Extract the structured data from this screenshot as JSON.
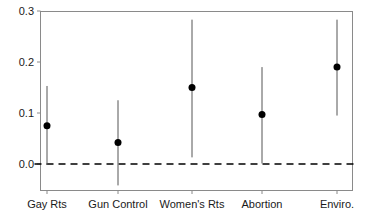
{
  "chart_data": {
    "type": "scatter",
    "title": "",
    "subtitle": "",
    "xlabel": "",
    "ylabel": "",
    "categories": [
      "Gay Rts",
      "Gun Control",
      "Women's Rts",
      "Abortion",
      "Enviro."
    ],
    "values": [
      0.075,
      0.042,
      0.15,
      0.097,
      0.19
    ],
    "error_low": [
      -0.002,
      -0.042,
      0.013,
      0.001,
      0.095
    ],
    "error_high": [
      0.153,
      0.125,
      0.283,
      0.19,
      0.283
    ],
    "ylim": [
      -0.05,
      0.3
    ],
    "yticks": [
      0.0,
      0.1,
      0.2,
      0.3
    ],
    "ytick_labels": [
      "0.0",
      "0.1",
      "0.2",
      "0.3"
    ],
    "grid": false,
    "legend": "none",
    "reference_line": {
      "value": 0.0,
      "style": "dashed",
      "color": "#000000"
    },
    "marker": {
      "shape": "circle",
      "filled": true,
      "color": "#000000",
      "size_px": 7
    },
    "errorbar": {
      "color": "#555555",
      "width_px": 1
    },
    "frame": {
      "color": "#8a8a8a",
      "top": true,
      "right": true,
      "bottom": true,
      "left": true
    },
    "series": [
      {
        "name": "estimate",
        "points": [
          {
            "category": "Gay Rts",
            "value": 0.075,
            "low": -0.002,
            "high": 0.153
          },
          {
            "category": "Gun Control",
            "value": 0.042,
            "low": -0.042,
            "high": 0.125
          },
          {
            "category": "Women's Rts",
            "value": 0.15,
            "low": 0.013,
            "high": 0.283
          },
          {
            "category": "Abortion",
            "value": 0.097,
            "low": 0.001,
            "high": 0.19
          },
          {
            "category": "Enviro.",
            "value": 0.19,
            "low": 0.095,
            "high": 0.283
          }
        ]
      }
    ]
  },
  "axis": {
    "y_tick_labels": [
      "0.0",
      "0.1",
      "0.2",
      "0.3"
    ],
    "x_tick_labels": [
      "Gay Rts",
      "Gun Control",
      "Women's Rts",
      "Abortion",
      "Enviro."
    ]
  }
}
